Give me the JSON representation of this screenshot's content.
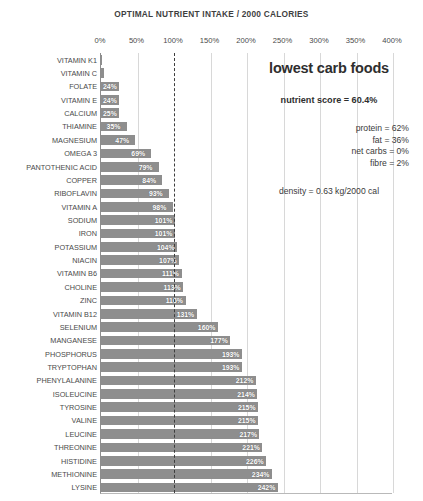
{
  "chart_data": {
    "type": "bar",
    "orientation": "horizontal",
    "title": "OPTIMAL NUTRIENT INTAKE / 2000 CALORIES",
    "xlabel": "",
    "ylabel": "",
    "xlim": [
      0,
      400
    ],
    "grid": true,
    "legend": "none",
    "reference_line": 100,
    "xticks": [
      "0%",
      "50%",
      "100%",
      "150%",
      "200%",
      "250%",
      "300%",
      "350%",
      "400%"
    ],
    "xtick_values": [
      0,
      50,
      100,
      150,
      200,
      250,
      300,
      350,
      400
    ],
    "bar_color": "#8e8e8e",
    "categories": [
      "VITAMIN K1",
      "VITAMIN C",
      "FOLATE",
      "VITAMIN E",
      "CALCIUM",
      "THIAMINE",
      "MAGNESIUM",
      "OMEGA 3",
      "PANTOTHENIC ACID",
      "COPPER",
      "RIBOFLAVIN",
      "VITAMIN A",
      "SODIUM",
      "IRON",
      "POTASSIUM",
      "NIACIN",
      "VITAMIN B6",
      "CHOLINE",
      "ZINC",
      "VITAMIN B12",
      "SELENIUM",
      "MANGANESE",
      "PHOSPHORUS",
      "TRYPTOPHAN",
      "PHENYLALANINE",
      "ISOLEUCINE",
      "TYROSINE",
      "VALINE",
      "LEUCINE",
      "THREONINE",
      "HISTIDINE",
      "METHIONINE",
      "LYSINE"
    ],
    "values": [
      1,
      4,
      24,
      24,
      25,
      35,
      47,
      69,
      79,
      84,
      93,
      98,
      101,
      101,
      104,
      107,
      111,
      113,
      116,
      131,
      160,
      177,
      193,
      193,
      212,
      214,
      215,
      215,
      217,
      221,
      226,
      234,
      242
    ],
    "value_labels": [
      "",
      "",
      "24%",
      "24%",
      "25%",
      "35%",
      "47%",
      "69%",
      "79%",
      "84%",
      "93%",
      "98%",
      "101%",
      "101%",
      "104%",
      "107%",
      "111%",
      "113%",
      "116%",
      "131%",
      "160%",
      "177%",
      "193%",
      "193%",
      "212%",
      "214%",
      "215%",
      "215%",
      "217%",
      "221%",
      "226%",
      "234%",
      "242%"
    ]
  },
  "info_panel": {
    "heading": "lowest carb foods",
    "nutrient_score": "nutrient score = 60.4%",
    "macros": [
      "protein = 62%",
      "fat = 36%",
      "net carbs = 0%",
      "fibre = 2%"
    ],
    "density": "density = 0.63 kg/2000 cal"
  }
}
